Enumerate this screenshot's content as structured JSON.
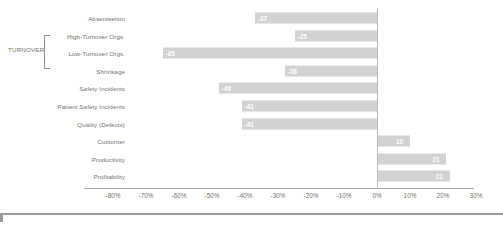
{
  "chart_data": {
    "type": "bar",
    "orientation": "horizontal",
    "title": "",
    "subtitle": "",
    "xlabel": "",
    "ylabel": "",
    "xlim": [
      -80,
      30
    ],
    "xtick_step": 10,
    "grid": false,
    "legend": null,
    "value_suffix": "%",
    "group_label": "TURNOVER",
    "xticks": [
      {
        "label": "-80%",
        "value": -80
      },
      {
        "label": "-70%",
        "value": -70
      },
      {
        "label": "-60%",
        "value": -60
      },
      {
        "label": "-50%",
        "value": -50
      },
      {
        "label": "-40%",
        "value": -40
      },
      {
        "label": "-30%",
        "value": -30
      },
      {
        "label": "-20%",
        "value": -20
      },
      {
        "label": "-10%",
        "value": -10
      },
      {
        "label": "0%",
        "value": 0
      },
      {
        "label": "10%",
        "value": 10
      },
      {
        "label": "20%",
        "value": 20
      },
      {
        "label": "30%",
        "value": 30
      }
    ],
    "categories": [
      "Absenteeism",
      "High-Turnover Orgs.",
      "Low-Turnover Orgs.",
      "Shrinkage",
      "Safety Incidents",
      "Patient Safety Incidents",
      "Quality (Defects)",
      "Customer",
      "Productivity",
      "Profitability"
    ],
    "values": [
      -37,
      -25,
      -65,
      -28,
      -48,
      -41,
      -41,
      10,
      21,
      22
    ],
    "data_labels": [
      "-37",
      "-25",
      "-65",
      "-28",
      "-48",
      "-41",
      "-41",
      "10",
      "21",
      "22"
    ],
    "bars": [
      {
        "category": "Absenteeism",
        "value": -37,
        "label": "-37",
        "grouped": false
      },
      {
        "category": "High-Turnover Orgs.",
        "value": -25,
        "label": "-25",
        "grouped": true
      },
      {
        "category": "Low-Turnover Orgs.",
        "value": -65,
        "label": "-65",
        "grouped": true
      },
      {
        "category": "Shrinkage",
        "value": -28,
        "label": "-28",
        "grouped": false
      },
      {
        "category": "Safety Incidents",
        "value": -48,
        "label": "-48",
        "grouped": false
      },
      {
        "category": "Patient Safety Incidents",
        "value": -41,
        "label": "-41",
        "grouped": false
      },
      {
        "category": "Quality (Defects)",
        "value": -41,
        "label": "-41",
        "grouped": false
      },
      {
        "category": "Customer",
        "value": 10,
        "label": "10",
        "grouped": false
      },
      {
        "category": "Productivity",
        "value": 21,
        "label": "21",
        "grouped": false
      },
      {
        "category": "Profitability",
        "value": 22,
        "label": "22",
        "grouped": false
      }
    ],
    "colors": {
      "bar": "#d2d2d2",
      "data_label": "#ffffff",
      "axis": "#a9a9a9",
      "zero_line": "#b9b9b9",
      "text": "#6f6f6f",
      "background": "#ffffff",
      "rule": "#9a9a9a"
    }
  }
}
